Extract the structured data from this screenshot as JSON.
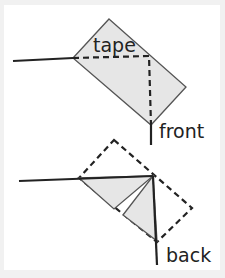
{
  "diagram": {
    "top_figure": {
      "tape_label": "tape",
      "end_label": "front"
    },
    "bottom_figure": {
      "end_label": "back"
    },
    "colors": {
      "background": "#f1f1f1",
      "panel": "#ffffff",
      "fill": "#e6e6e6",
      "stroke": "#222222",
      "outline": "#555555"
    }
  }
}
